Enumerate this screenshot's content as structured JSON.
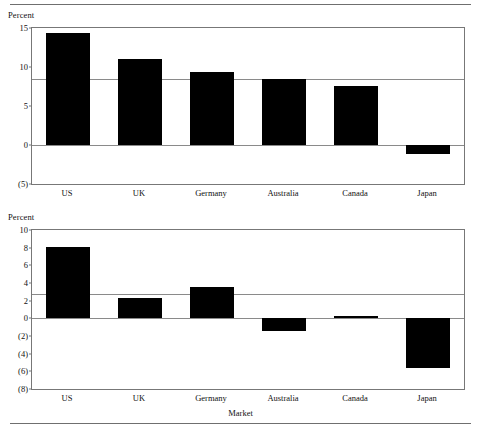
{
  "chart_data": [
    {
      "type": "bar",
      "panel": "top",
      "title": "",
      "xlabel": "",
      "ylabel": "Percent",
      "categories": [
        "US",
        "UK",
        "Germany",
        "Australia",
        "Canada",
        "Japan"
      ],
      "values": [
        14.3,
        11.0,
        9.4,
        8.4,
        7.6,
        -1.2
      ],
      "ylim": [
        -5,
        15
      ],
      "yticks": [
        15,
        10,
        5,
        0,
        -5
      ],
      "ytick_labels": [
        "15",
        "10",
        "5",
        "0",
        "(5)"
      ],
      "grid": false,
      "legend": "none",
      "reference_line": {
        "value": 8.5,
        "label": ""
      },
      "bar_color": "#000000"
    },
    {
      "type": "bar",
      "panel": "bottom",
      "title": "",
      "xlabel": "Market",
      "ylabel": "Percent",
      "categories": [
        "US",
        "UK",
        "Germany",
        "Australia",
        "Canada",
        "Japan"
      ],
      "values": [
        8.1,
        2.3,
        3.5,
        -1.4,
        0.3,
        -5.6
      ],
      "ylim": [
        -8,
        10
      ],
      "yticks": [
        10,
        8,
        6,
        4,
        2,
        0,
        -2,
        -4,
        -6,
        -8
      ],
      "ytick_labels": [
        "10",
        "8",
        "6",
        "4",
        "2",
        "0",
        "(2)",
        "(4)",
        "(6)",
        "(8)"
      ],
      "grid": false,
      "legend": "none",
      "reference_line": {
        "value": 2.7,
        "label": ""
      },
      "bar_color": "#000000"
    }
  ],
  "panels": {
    "top": {
      "ylabel": "Percent",
      "ytick_labels": [
        "15",
        "10",
        "5",
        "0",
        "(5)"
      ],
      "categories": [
        "US",
        "UK",
        "Germany",
        "Australia",
        "Canada",
        "Japan"
      ]
    },
    "bottom": {
      "ylabel": "Percent",
      "ytick_labels": [
        "10",
        "8",
        "6",
        "4",
        "2",
        "0",
        "(2)",
        "(4)",
        "(6)",
        "(8)"
      ],
      "categories": [
        "US",
        "UK",
        "Germany",
        "Australia",
        "Canada",
        "Japan"
      ],
      "xlabel": "Market"
    }
  }
}
